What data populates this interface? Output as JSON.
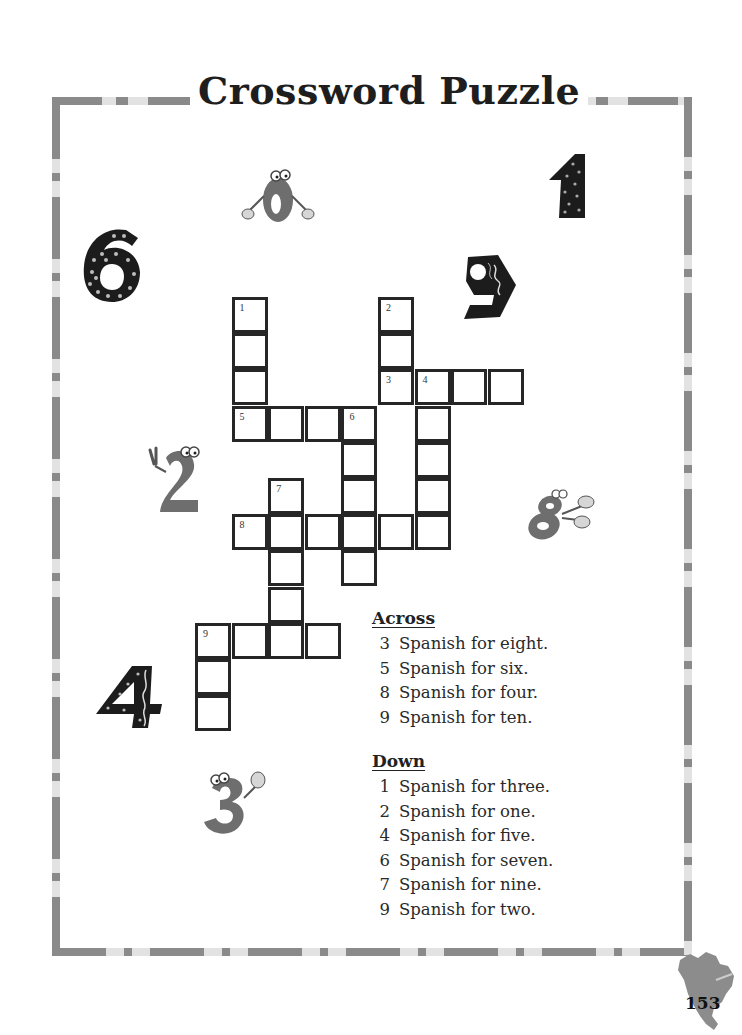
{
  "page": {
    "title": "Crossword Puzzle",
    "page_number": "153"
  },
  "puzzle": {
    "cell_size": 36,
    "origin": {
      "x": 195,
      "y": 297
    },
    "cells": [
      {
        "c": 1,
        "r": 0,
        "num": "1"
      },
      {
        "c": 1,
        "r": 1
      },
      {
        "c": 1,
        "r": 2
      },
      {
        "c": 1,
        "r": 3,
        "num": "5"
      },
      {
        "c": 2,
        "r": 3
      },
      {
        "c": 3,
        "r": 3
      },
      {
        "c": 4,
        "r": 3,
        "num": "6"
      },
      {
        "c": 5,
        "r": 0,
        "num": "2"
      },
      {
        "c": 5,
        "r": 1
      },
      {
        "c": 5,
        "r": 2,
        "num": "3"
      },
      {
        "c": 6,
        "r": 2,
        "num": "4"
      },
      {
        "c": 7,
        "r": 2
      },
      {
        "c": 8,
        "r": 2
      },
      {
        "c": 6,
        "r": 3
      },
      {
        "c": 6,
        "r": 4
      },
      {
        "c": 6,
        "r": 5
      },
      {
        "c": 6,
        "r": 6
      },
      {
        "c": 4,
        "r": 4
      },
      {
        "c": 4,
        "r": 5
      },
      {
        "c": 4,
        "r": 6
      },
      {
        "c": 4,
        "r": 7
      },
      {
        "c": 2,
        "r": 5,
        "num": "7"
      },
      {
        "c": 1,
        "r": 6,
        "num": "8"
      },
      {
        "c": 2,
        "r": 6
      },
      {
        "c": 3,
        "r": 6
      },
      {
        "c": 5,
        "r": 6
      },
      {
        "c": 2,
        "r": 7
      },
      {
        "c": 2,
        "r": 8
      },
      {
        "c": 2,
        "r": 9
      },
      {
        "c": 0,
        "r": 9,
        "num": "9"
      },
      {
        "c": 1,
        "r": 9
      },
      {
        "c": 3,
        "r": 9
      },
      {
        "c": 0,
        "r": 10
      },
      {
        "c": 0,
        "r": 11
      }
    ]
  },
  "clues": {
    "across_title": "Across",
    "across": [
      {
        "num": "3",
        "text": "Spanish for eight."
      },
      {
        "num": "5",
        "text": "Spanish for six."
      },
      {
        "num": "8",
        "text": "Spanish for four."
      },
      {
        "num": "9",
        "text": "Spanish for ten."
      }
    ],
    "down_title": "Down",
    "down": [
      {
        "num": "1",
        "text": "Spanish for three."
      },
      {
        "num": "2",
        "text": "Spanish for one."
      },
      {
        "num": "4",
        "text": "Spanish for five."
      },
      {
        "num": "6",
        "text": "Spanish for seven."
      },
      {
        "num": "7",
        "text": "Spanish for nine."
      },
      {
        "num": "9",
        "text": "Spanish for two."
      }
    ]
  },
  "decorations": [
    {
      "name": "number-six-dotted-icon",
      "glyph": "6"
    },
    {
      "name": "number-zero-cartoon-icon",
      "glyph": "0"
    },
    {
      "name": "number-one-dotted-icon",
      "glyph": "1"
    },
    {
      "name": "number-nine-striped-icon",
      "glyph": "9"
    },
    {
      "name": "number-two-cartoon-icon",
      "glyph": "2"
    },
    {
      "name": "number-eight-cartoon-icon",
      "glyph": "8"
    },
    {
      "name": "number-four-dotted-icon",
      "glyph": "4"
    },
    {
      "name": "number-three-cartoon-icon",
      "glyph": "3"
    }
  ],
  "colors": {
    "border_dark": "#8a8a8a",
    "border_light": "#e2e2e2",
    "grid_line": "#262626",
    "text": "#222222"
  }
}
